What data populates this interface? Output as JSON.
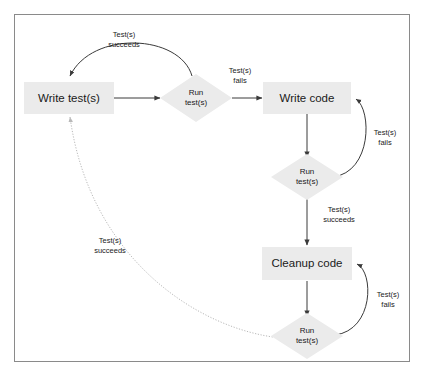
{
  "diagram": {
    "border_color": "#8a8a8a",
    "node_fill": "#ebebeb",
    "line_color": "#3a3a3a",
    "dotted_color": "#b9b9b9",
    "nodes": [
      {
        "id": "write-tests",
        "label": "Write test(s)",
        "shape": "box"
      },
      {
        "id": "run-tests-1",
        "label": "Run\ntest(s)",
        "shape": "diamond"
      },
      {
        "id": "write-code",
        "label": "Write code",
        "shape": "box"
      },
      {
        "id": "run-tests-2",
        "label": "Run\ntest(s)",
        "shape": "diamond"
      },
      {
        "id": "cleanup-code",
        "label": "Cleanup code",
        "shape": "box"
      },
      {
        "id": "run-tests-3",
        "label": "Run\ntest(s)",
        "shape": "diamond"
      }
    ],
    "edge_labels": [
      {
        "id": "tests-succeeds-top",
        "text": "Test(s)\nsucceeds"
      },
      {
        "id": "tests-fails-top",
        "text": "Test(s)\nfails"
      },
      {
        "id": "tests-fails-right-1",
        "text": "Test(s)\nfails"
      },
      {
        "id": "tests-succeeds-middle",
        "text": "Test(s)\nsucceeds"
      },
      {
        "id": "tests-fails-right-2",
        "text": "Test(s)\nfails"
      },
      {
        "id": "tests-succeeds-return",
        "text": "Test(s)\nsucceeds"
      }
    ]
  }
}
